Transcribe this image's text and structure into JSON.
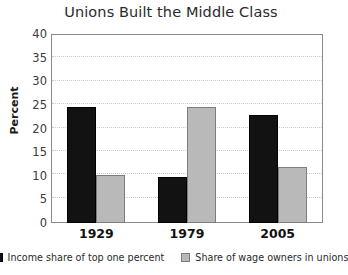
{
  "chart_data": {
    "type": "bar",
    "title": "Unions Built the Middle Class",
    "xlabel": "",
    "ylabel": "Percent",
    "categories": [
      "1929",
      "1979",
      "2005"
    ],
    "series": [
      {
        "name": "Income share of top one percent",
        "color": "#121212",
        "values": [
          24.5,
          9.8,
          22.8
        ]
      },
      {
        "name": "Share of wage owners in unions",
        "color": "#b9b9b9",
        "values": [
          10.1,
          24.5,
          11.8
        ]
      }
    ],
    "ylim": [
      0,
      40
    ],
    "yticks": [
      0,
      5,
      10,
      15,
      20,
      25,
      30,
      35,
      40
    ],
    "ytick_labels": [
      "0",
      "5",
      "10",
      "15",
      "20",
      "25",
      "30",
      "35",
      "40"
    ],
    "grid": true,
    "grid_style": "dotted horizontal",
    "legend_position": "bottom"
  }
}
